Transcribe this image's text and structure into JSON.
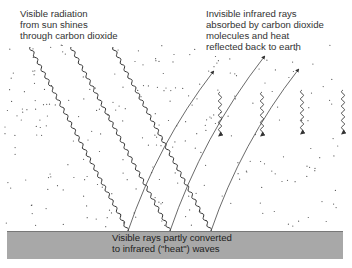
{
  "labels": {
    "visible_radiation": "Visible radiation\nfrom sun shines\nthrough carbon dioxide",
    "infrared_absorbed": "Invisible infrared rays\nabsorbed by carbon dioxide\nmolecules and heat\nreflected back to earth",
    "ground": "Visible rays partly converted\nto infrared (\"heat\") waves"
  },
  "colors": {
    "ground": "#a8a8a8",
    "line": "#333333",
    "dots": "#555555"
  },
  "diagram": {
    "incoming_visible_rays": [
      {
        "from": [
          30,
          47
        ],
        "to": [
          128,
          231
        ]
      },
      {
        "from": [
          71,
          47
        ],
        "to": [
          170,
          231
        ]
      },
      {
        "from": [
          113,
          47
        ],
        "to": [
          211,
          231
        ]
      }
    ],
    "outgoing_infrared_rays": [
      {
        "from": [
          128,
          231
        ],
        "to": [
          213,
          72
        ]
      },
      {
        "from": [
          170,
          231
        ],
        "to": [
          264,
          57
        ]
      },
      {
        "from": [
          211,
          231
        ],
        "to": [
          298,
          70
        ]
      }
    ],
    "reflected_heat_arrows": [
      {
        "x": 220,
        "y1": 92,
        "y2": 135
      },
      {
        "x": 262,
        "y1": 92,
        "y2": 135
      },
      {
        "x": 302,
        "y1": 90,
        "y2": 133
      },
      {
        "x": 343,
        "y1": 90,
        "y2": 133
      }
    ]
  }
}
